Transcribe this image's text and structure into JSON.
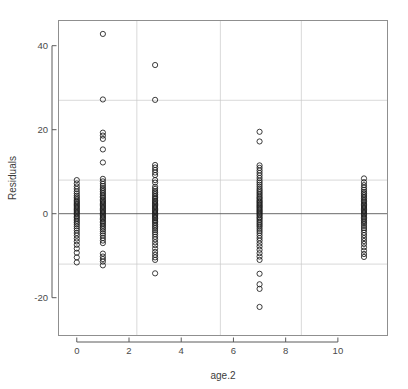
{
  "chart_data": {
    "type": "scatter",
    "title": "",
    "xlabel": "age.2",
    "ylabel": "Residuals",
    "xlim": [
      -0.7,
      11.9
    ],
    "ylim": [
      -29,
      46
    ],
    "grid": true,
    "legend": "none",
    "marker": "open-circle",
    "xticks": [
      0,
      2,
      4,
      6,
      8,
      10
    ],
    "xtick_labels": [
      "0",
      "2",
      "4",
      "6",
      "8",
      "10"
    ],
    "yticks": [
      -20,
      0,
      20,
      40
    ],
    "ytick_labels": [
      "-20",
      "0",
      "20",
      "40"
    ],
    "gridlines_y": [
      27,
      8,
      0,
      -12
    ],
    "gridlines_x": [
      2.3,
      5.5,
      8.6
    ],
    "zero_line_y": 0,
    "x_categories": [
      0,
      1,
      3,
      7,
      11
    ],
    "series": [
      {
        "name": "residuals",
        "points": [
          [
            0,
            8.0
          ],
          [
            0,
            7.2
          ],
          [
            0,
            6.5
          ],
          [
            0,
            5.9
          ],
          [
            0,
            5.3
          ],
          [
            0,
            4.8
          ],
          [
            0,
            4.3
          ],
          [
            0,
            3.9
          ],
          [
            0,
            3.5
          ],
          [
            0,
            3.1
          ],
          [
            0,
            2.8
          ],
          [
            0,
            2.5
          ],
          [
            0,
            2.2
          ],
          [
            0,
            1.9
          ],
          [
            0,
            1.6
          ],
          [
            0,
            1.3
          ],
          [
            0,
            1.0
          ],
          [
            0,
            0.7
          ],
          [
            0,
            0.4
          ],
          [
            0,
            0.1
          ],
          [
            0,
            -0.2
          ],
          [
            0,
            -0.6
          ],
          [
            0,
            -0.9
          ],
          [
            0,
            -1.3
          ],
          [
            0,
            -1.7
          ],
          [
            0,
            -2.1
          ],
          [
            0,
            -2.5
          ],
          [
            0,
            -3.0
          ],
          [
            0,
            -3.5
          ],
          [
            0,
            -4.0
          ],
          [
            0,
            -4.6
          ],
          [
            0,
            -5.2
          ],
          [
            0,
            -5.9
          ],
          [
            0,
            -6.6
          ],
          [
            0,
            -7.4
          ],
          [
            0,
            -8.3
          ],
          [
            0,
            -9.3
          ],
          [
            0,
            -10.4
          ],
          [
            0,
            -11.6
          ],
          [
            1,
            42.8
          ],
          [
            1,
            27.2
          ],
          [
            1,
            19.3
          ],
          [
            1,
            18.6
          ],
          [
            1,
            17.8
          ],
          [
            1,
            15.3
          ],
          [
            1,
            12.2
          ],
          [
            1,
            8.3
          ],
          [
            1,
            7.7
          ],
          [
            1,
            7.1
          ],
          [
            1,
            6.6
          ],
          [
            1,
            6.1
          ],
          [
            1,
            5.7
          ],
          [
            1,
            5.3
          ],
          [
            1,
            4.9
          ],
          [
            1,
            4.5
          ],
          [
            1,
            4.1
          ],
          [
            1,
            3.8
          ],
          [
            1,
            3.4
          ],
          [
            1,
            3.1
          ],
          [
            1,
            2.8
          ],
          [
            1,
            2.5
          ],
          [
            1,
            2.2
          ],
          [
            1,
            1.9
          ],
          [
            1,
            1.6
          ],
          [
            1,
            1.3
          ],
          [
            1,
            1.0
          ],
          [
            1,
            0.7
          ],
          [
            1,
            0.4
          ],
          [
            1,
            0.1
          ],
          [
            1,
            -0.2
          ],
          [
            1,
            -0.5
          ],
          [
            1,
            -0.8
          ],
          [
            1,
            -1.1
          ],
          [
            1,
            -1.4
          ],
          [
            1,
            -1.8
          ],
          [
            1,
            -2.1
          ],
          [
            1,
            -2.5
          ],
          [
            1,
            -2.9
          ],
          [
            1,
            -3.3
          ],
          [
            1,
            -3.7
          ],
          [
            1,
            -4.2
          ],
          [
            1,
            -4.7
          ],
          [
            1,
            -5.2
          ],
          [
            1,
            -5.8
          ],
          [
            1,
            -6.4
          ],
          [
            1,
            -7.0
          ],
          [
            1,
            -9.5
          ],
          [
            1,
            -10.2
          ],
          [
            1,
            -10.8
          ],
          [
            1,
            -11.4
          ],
          [
            1,
            -12.3
          ],
          [
            3,
            35.4
          ],
          [
            3,
            27.1
          ],
          [
            3,
            11.6
          ],
          [
            3,
            11.0
          ],
          [
            3,
            10.4
          ],
          [
            3,
            9.8
          ],
          [
            3,
            9.2
          ],
          [
            3,
            8.0
          ],
          [
            3,
            7.4
          ],
          [
            3,
            6.4
          ],
          [
            3,
            5.9
          ],
          [
            3,
            5.4
          ],
          [
            3,
            5.0
          ],
          [
            3,
            4.6
          ],
          [
            3,
            4.2
          ],
          [
            3,
            3.8
          ],
          [
            3,
            3.5
          ],
          [
            3,
            3.1
          ],
          [
            3,
            2.8
          ],
          [
            3,
            2.5
          ],
          [
            3,
            2.2
          ],
          [
            3,
            1.9
          ],
          [
            3,
            1.6
          ],
          [
            3,
            1.3
          ],
          [
            3,
            1.0
          ],
          [
            3,
            0.7
          ],
          [
            3,
            0.4
          ],
          [
            3,
            0.1
          ],
          [
            3,
            -0.2
          ],
          [
            3,
            -0.5
          ],
          [
            3,
            -0.8
          ],
          [
            3,
            -1.1
          ],
          [
            3,
            -1.5
          ],
          [
            3,
            -1.8
          ],
          [
            3,
            -2.2
          ],
          [
            3,
            -2.6
          ],
          [
            3,
            -3.0
          ],
          [
            3,
            -3.4
          ],
          [
            3,
            -3.9
          ],
          [
            3,
            -4.4
          ],
          [
            3,
            -4.9
          ],
          [
            3,
            -5.5
          ],
          [
            3,
            -6.1
          ],
          [
            3,
            -6.8
          ],
          [
            3,
            -7.5
          ],
          [
            3,
            -8.3
          ],
          [
            3,
            -9.1
          ],
          [
            3,
            -9.8
          ],
          [
            3,
            -10.4
          ],
          [
            3,
            -11.0
          ],
          [
            3,
            -14.2
          ],
          [
            7,
            19.5
          ],
          [
            7,
            17.2
          ],
          [
            7,
            11.5
          ],
          [
            7,
            10.9
          ],
          [
            7,
            10.3
          ],
          [
            7,
            9.7
          ],
          [
            7,
            9.1
          ],
          [
            7,
            8.5
          ],
          [
            7,
            7.9
          ],
          [
            7,
            7.4
          ],
          [
            7,
            6.9
          ],
          [
            7,
            6.4
          ],
          [
            7,
            5.9
          ],
          [
            7,
            5.5
          ],
          [
            7,
            5.1
          ],
          [
            7,
            4.7
          ],
          [
            7,
            4.3
          ],
          [
            7,
            3.9
          ],
          [
            7,
            3.6
          ],
          [
            7,
            3.2
          ],
          [
            7,
            2.9
          ],
          [
            7,
            2.6
          ],
          [
            7,
            2.3
          ],
          [
            7,
            2.0
          ],
          [
            7,
            1.7
          ],
          [
            7,
            1.4
          ],
          [
            7,
            1.1
          ],
          [
            7,
            0.8
          ],
          [
            7,
            0.5
          ],
          [
            7,
            0.2
          ],
          [
            7,
            -0.1
          ],
          [
            7,
            -0.4
          ],
          [
            7,
            -0.8
          ],
          [
            7,
            -1.1
          ],
          [
            7,
            -1.5
          ],
          [
            7,
            -1.9
          ],
          [
            7,
            -2.3
          ],
          [
            7,
            -2.7
          ],
          [
            7,
            -3.1
          ],
          [
            7,
            -3.6
          ],
          [
            7,
            -4.1
          ],
          [
            7,
            -4.6
          ],
          [
            7,
            -5.2
          ],
          [
            7,
            -5.8
          ],
          [
            7,
            -6.4
          ],
          [
            7,
            -7.1
          ],
          [
            7,
            -7.8
          ],
          [
            7,
            -8.6
          ],
          [
            7,
            -9.4
          ],
          [
            7,
            -10.2
          ],
          [
            7,
            -11.0
          ],
          [
            7,
            -14.3
          ],
          [
            7,
            -16.8
          ],
          [
            7,
            -17.9
          ],
          [
            7,
            -22.2
          ],
          [
            11,
            8.4
          ],
          [
            11,
            7.5
          ],
          [
            11,
            6.8
          ],
          [
            11,
            6.2
          ],
          [
            11,
            5.7
          ],
          [
            11,
            5.2
          ],
          [
            11,
            4.8
          ],
          [
            11,
            4.4
          ],
          [
            11,
            4.0
          ],
          [
            11,
            3.6
          ],
          [
            11,
            3.2
          ],
          [
            11,
            2.9
          ],
          [
            11,
            2.5
          ],
          [
            11,
            2.2
          ],
          [
            11,
            1.9
          ],
          [
            11,
            1.6
          ],
          [
            11,
            1.3
          ],
          [
            11,
            1.0
          ],
          [
            11,
            0.7
          ],
          [
            11,
            0.4
          ],
          [
            11,
            0.1
          ],
          [
            11,
            -0.2
          ],
          [
            11,
            -0.5
          ],
          [
            11,
            -0.9
          ],
          [
            11,
            -1.2
          ],
          [
            11,
            -1.6
          ],
          [
            11,
            -2.0
          ],
          [
            11,
            -2.4
          ],
          [
            11,
            -2.9
          ],
          [
            11,
            -3.4
          ],
          [
            11,
            -3.9
          ],
          [
            11,
            -4.5
          ],
          [
            11,
            -5.1
          ],
          [
            11,
            -5.8
          ],
          [
            11,
            -6.5
          ],
          [
            11,
            -7.2
          ],
          [
            11,
            -8.0
          ],
          [
            11,
            -8.8
          ],
          [
            11,
            -9.6
          ],
          [
            11,
            -10.3
          ]
        ]
      }
    ]
  }
}
